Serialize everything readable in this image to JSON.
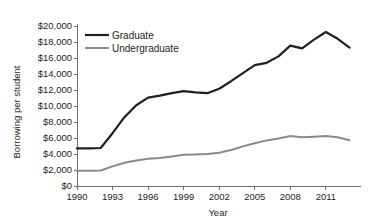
{
  "chart_data": {
    "type": "line",
    "title": "",
    "xlabel": "Year",
    "ylabel": "Borrowing per student",
    "xlim": [
      1990,
      2013
    ],
    "ylim": [
      0,
      20000
    ],
    "grid": false,
    "legend_position": "top-left",
    "x_tick_labels": [
      "1990",
      "1993",
      "1996",
      "1999",
      "2002",
      "2005",
      "2008",
      "2011"
    ],
    "x_tick_values": [
      1990,
      1993,
      1996,
      1999,
      2002,
      2005,
      2008,
      2011
    ],
    "y_tick_labels": [
      "$0",
      "$2,000",
      "$4,000",
      "$6,000",
      "$8,000",
      "$10,000",
      "$12,000",
      "$14,000",
      "$16,000",
      "$18,000",
      "$20,000"
    ],
    "y_tick_values": [
      0,
      2000,
      4000,
      6000,
      8000,
      10000,
      12000,
      14000,
      16000,
      18000,
      20000
    ],
    "x": [
      1990,
      1991,
      1992,
      1993,
      1994,
      1995,
      1996,
      1997,
      1998,
      1999,
      2000,
      2001,
      2002,
      2003,
      2004,
      2005,
      2006,
      2007,
      2008,
      2009,
      2010,
      2011,
      2012,
      2013
    ],
    "series": [
      {
        "name": "Graduate",
        "color": "#231f20",
        "width": 2.2,
        "values": [
          4700,
          4700,
          4750,
          6600,
          8600,
          10100,
          11050,
          11300,
          11600,
          11850,
          11700,
          11600,
          12150,
          13100,
          14100,
          15100,
          15400,
          16200,
          17550,
          17200,
          18300,
          19250,
          18400,
          17300
        ]
      },
      {
        "name": "Undergraduate",
        "color": "#8a8a8a",
        "width": 2.0,
        "values": [
          1900,
          1900,
          1930,
          2450,
          2900,
          3200,
          3400,
          3500,
          3700,
          3900,
          3950,
          4000,
          4150,
          4500,
          4950,
          5350,
          5700,
          5950,
          6250,
          6080,
          6150,
          6250,
          6100,
          5720
        ]
      }
    ]
  },
  "legend": {
    "items": [
      {
        "label": "Graduate",
        "color": "#231f20"
      },
      {
        "label": "Undergraduate",
        "color": "#8a8a8a"
      }
    ]
  },
  "axes": {
    "x_title": "Year",
    "y_title": "Borrowing per student"
  }
}
